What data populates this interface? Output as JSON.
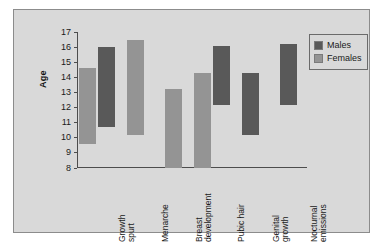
{
  "chart_data": {
    "type": "bar",
    "title": "",
    "subtitle": "",
    "xlabel": "",
    "ylabel": "Age",
    "ylim": [
      8,
      17
    ],
    "yticks": [
      17,
      16,
      15,
      14,
      13,
      12,
      11,
      10,
      9,
      8
    ],
    "grid": false,
    "legend_position": "top-right",
    "note": "Floating (range) bars: each bar spans the age interval from start to end for that pubertal event.",
    "categories": [
      "Growth\nspurt",
      "Menarche",
      "Breast\ndevelopment",
      "Pubic hair",
      "Genital\ngrowth",
      "Nocturnal\nemissions"
    ],
    "series": [
      {
        "name": "Males",
        "color": "#595959",
        "ranges": [
          {
            "category": "Growth spurt",
            "start": 10.7,
            "end": 16.0
          },
          {
            "category": "Menarche",
            "start": null,
            "end": null
          },
          {
            "category": "Breast development",
            "start": null,
            "end": null
          },
          {
            "category": "Pubic hair",
            "start": 12.2,
            "end": 16.1
          },
          {
            "category": "Genital growth",
            "start": 10.2,
            "end": 14.3
          },
          {
            "category": "Nocturnal emissions",
            "start": 12.2,
            "end": 16.2
          }
        ]
      },
      {
        "name": "Females",
        "color": "#949494",
        "ranges": [
          {
            "category": "Growth spurt",
            "start": 9.6,
            "end": 14.6
          },
          {
            "category": "Menarche",
            "start": 10.2,
            "end": 16.5
          },
          {
            "category": "Breast development",
            "start": 8.0,
            "end": 13.2
          },
          {
            "category": "Pubic hair",
            "start": 8.0,
            "end": 14.3
          },
          {
            "category": "Genital growth",
            "start": null,
            "end": null
          },
          {
            "category": "Nocturnal emissions",
            "start": null,
            "end": null
          }
        ]
      }
    ]
  },
  "legend": {
    "items": [
      {
        "label": "Males",
        "color": "#595959"
      },
      {
        "label": "Females",
        "color": "#949494"
      }
    ]
  }
}
